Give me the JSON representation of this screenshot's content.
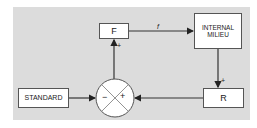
{
  "diagram": {
    "nodes": {
      "f_block": {
        "label": "F"
      },
      "internal_milieu": {
        "line1": "INTERNAL",
        "line2": "MILIEU"
      },
      "standard": {
        "label": "STANDARD"
      },
      "r_block": {
        "label": "R"
      },
      "comparator": {
        "minus": "−",
        "plus": "+"
      }
    },
    "edges": {
      "f_to_milieu": {
        "label": "f"
      },
      "milieu_to_r": {
        "sign": "+"
      },
      "comparator_to_f": {
        "sign": "+"
      }
    },
    "colors": {
      "background": "#dcdcdc",
      "line": "#333333",
      "box": "#ffffff"
    }
  }
}
